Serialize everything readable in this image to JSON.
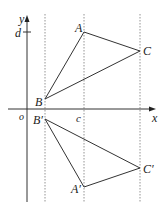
{
  "diagram": {
    "axes": {
      "x_label": "x",
      "y_label": "y",
      "origin_label": "o",
      "y_tick_label": "d",
      "x_tick_label": "c"
    },
    "points": {
      "A": {
        "label": "A",
        "x": 84,
        "y": 32
      },
      "B": {
        "label": "B",
        "x": 45,
        "y": 99
      },
      "C": {
        "label": "C",
        "x": 140,
        "y": 51
      },
      "A_prime": {
        "label": "A′",
        "x": 84,
        "y": 187
      },
      "B_prime": {
        "label": "B′",
        "x": 45,
        "y": 119
      },
      "C_prime": {
        "label": "C′",
        "x": 140,
        "y": 168
      }
    },
    "colors": {
      "line": "#333333",
      "dash": "#777777"
    }
  }
}
